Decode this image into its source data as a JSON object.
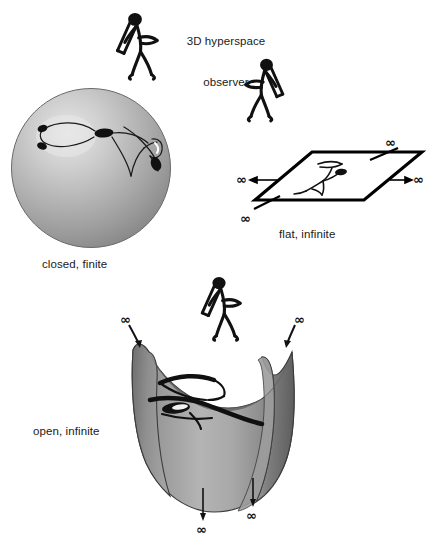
{
  "figure": {
    "background_color": "#ffffff",
    "width": 426,
    "height": 547
  },
  "labels": {
    "observer": "3D hyperspace\nobserver",
    "observer_line1": "3D hyperspace",
    "observer_line2": "observer",
    "closed": "closed, finite",
    "flat": "flat, infinite",
    "open": "open, infinite"
  },
  "infinity_symbol": "∞",
  "infinity_marks": {
    "flat_top_right": "∞",
    "flat_right": "∞",
    "flat_left": "∞",
    "flat_bottom_left": "∞",
    "open_top_left": "∞",
    "open_top_right": "∞",
    "open_bottom_left": "∞",
    "open_bottom_right": "∞"
  },
  "shapes": {
    "sphere": {
      "name": "closed-finite-sphere",
      "fill_light": "#d8d8d8",
      "fill_mid": "#a6a6a6",
      "fill_dark": "#808080",
      "stroke": "#555555"
    },
    "plane": {
      "name": "flat-infinite-plane",
      "stroke": "#000000",
      "fill": "#ffffff"
    },
    "saddle": {
      "name": "open-infinite-saddle",
      "fill_light": "#bdbdbd",
      "fill_mid": "#8c8c8c",
      "fill_dark": "#6b6b6b",
      "stroke": "#3a3a3a"
    }
  },
  "observers": [
    {
      "name": "hyperspace-observer-top",
      "description": "stick figure with telescope"
    },
    {
      "name": "hyperspace-observer-plane",
      "description": "stick figure with telescope facing left"
    },
    {
      "name": "hyperspace-observer-saddle",
      "description": "stick figure with telescope"
    }
  ],
  "embedded_figures": [
    {
      "name": "sphere-surface-figure",
      "description": "flattened stick figure drawn on sphere surface"
    },
    {
      "name": "plane-surface-figure",
      "description": "flattened stick figure drawn on plane surface"
    },
    {
      "name": "saddle-surface-figure",
      "description": "flattened stick figure drawn on saddle surface"
    }
  ]
}
